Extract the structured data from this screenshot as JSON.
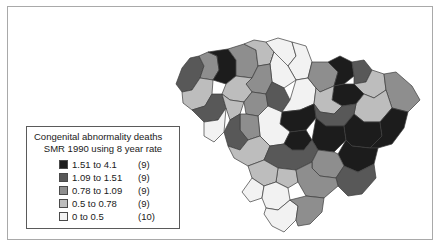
{
  "figure": {
    "kind": "choropleth-map",
    "region": "South Carolina counties",
    "background_color": "#ffffff",
    "frame_color": "#a9a9a9",
    "county_border_color": "#3c3c3c"
  },
  "legend": {
    "title_line_1": "Congenital abnormality deaths",
    "title_line_2": "SMR 1990 using 8 year rate",
    "rows": [
      {
        "range": "1.51 to 4.1",
        "count": "(9)",
        "color": "#1c1c1c"
      },
      {
        "range": "1.09 to 1.51",
        "count": "(9)",
        "color": "#585858"
      },
      {
        "range": "0.78 to 1.09",
        "count": "(9)",
        "color": "#8e8e8e"
      },
      {
        "range": "0.5 to 0.78",
        "count": "(9)",
        "color": "#bdbdbd"
      },
      {
        "range": "0 to 0.5",
        "count": "(10)",
        "color": "#f2f2f2"
      }
    ]
  },
  "chart_data": {
    "type": "map",
    "title": "Congenital abnormality deaths",
    "subtitle": "SMR 1990 using 8 year rate",
    "value_label": "SMR",
    "class_breaks": [
      0,
      0.5,
      0.78,
      1.09,
      1.51,
      4.1
    ],
    "class_counts": [
      10,
      9,
      9,
      9,
      9
    ],
    "class_colors": [
      "#f2f2f2",
      "#bdbdbd",
      "#8e8e8e",
      "#585858",
      "#1c1c1c"
    ],
    "total_regions": 46,
    "legend_position": "lower-left",
    "regions": [
      {
        "name": "Oconee",
        "class": 3,
        "points": "176,84 182,68 190,58 199,56 204,66 200,78 192,90 182,92"
      },
      {
        "name": "Pickens",
        "class": 2,
        "points": "199,56 204,66 200,78 213,80 219,70 217,56 208,52"
      },
      {
        "name": "Anderson",
        "class": 1,
        "points": "182,92 192,90 200,78 213,80 212,94 205,106 192,110 183,103"
      },
      {
        "name": "Greenville",
        "class": 4,
        "points": "208,52 217,56 219,70 213,80 226,84 236,76 236,60 228,49"
      },
      {
        "name": "Spartanburg",
        "class": 2,
        "points": "228,49 236,60 236,76 252,78 258,66 256,50 244,44"
      },
      {
        "name": "Cherokee",
        "class": 1,
        "points": "244,44 256,50 258,66 270,64 274,52 266,42 254,40"
      },
      {
        "name": "York",
        "class": 0,
        "points": "266,42 274,52 270,64 288,66 296,56 292,42 278,38"
      },
      {
        "name": "Lancaster",
        "class": 0,
        "points": "292,42 296,56 288,66 296,80 308,78 312,62 306,46"
      },
      {
        "name": "Chester",
        "class": 0,
        "points": "274,52 288,66 296,80 284,88 272,82 270,64"
      },
      {
        "name": "Union",
        "class": 2,
        "points": "252,78 258,66 270,64 272,82 266,94 252,92 246,84"
      },
      {
        "name": "Laurens",
        "class": 1,
        "points": "226,84 236,76 252,78 246,84 252,92 244,102 230,100 222,94"
      },
      {
        "name": "Abbeville",
        "class": 3,
        "points": "192,110 205,106 212,94 222,94 226,108 218,120 204,122"
      },
      {
        "name": "Greenwood",
        "class": 1,
        "points": "222,94 230,100 244,102 240,114 230,120 226,108"
      },
      {
        "name": "Newberry",
        "class": 2,
        "points": "244,102 252,92 266,94 268,106 258,116 246,114"
      },
      {
        "name": "Fairfield",
        "class": 3,
        "points": "266,94 272,82 284,88 290,100 282,112 270,110 268,106"
      },
      {
        "name": "Kershaw",
        "class": 0,
        "points": "290,100 296,80 308,78 316,88 314,104 300,110 282,112"
      },
      {
        "name": "Chesterfield",
        "class": 2,
        "points": "308,78 312,62 328,62 338,72 334,86 320,92 316,88"
      },
      {
        "name": "Marlboro",
        "class": 4,
        "points": "328,62 340,56 352,62 354,76 344,84 334,86 338,72"
      },
      {
        "name": "Dillon",
        "class": 3,
        "points": "352,62 364,60 372,70 366,82 354,84 354,76"
      },
      {
        "name": "Marion",
        "class": 1,
        "points": "366,82 372,70 384,74 386,90 374,98 364,94 354,84"
      },
      {
        "name": "Horry",
        "class": 2,
        "points": "384,74 396,72 412,86 420,100 408,112 392,108 386,90"
      },
      {
        "name": "Darlington",
        "class": 4,
        "points": "334,86 344,84 354,84 364,94 356,104 342,106 332,100"
      },
      {
        "name": "Florence",
        "class": 1,
        "points": "356,104 364,94 374,98 386,90 392,108 380,122 364,122 354,114"
      },
      {
        "name": "Lee",
        "class": 1,
        "points": "316,88 320,92 334,86 332,100 342,106 334,114 320,112 314,104"
      },
      {
        "name": "Sumter",
        "class": 3,
        "points": "314,104 320,112 334,114 342,106 356,104 354,114 344,126 326,126 316,118"
      },
      {
        "name": "Richland",
        "class": 4,
        "points": "282,112 300,110 314,104 316,118 306,130 290,132 280,124"
      },
      {
        "name": "Lexington",
        "class": 0,
        "points": "268,106 282,112 280,124 290,132 284,144 270,146 260,136 258,116"
      },
      {
        "name": "Saluda",
        "class": 2,
        "points": "246,114 258,116 260,136 248,140 240,130 240,114"
      },
      {
        "name": "Edgefield",
        "class": 3,
        "points": "230,120 240,114 240,130 248,140 240,150 228,146 224,132"
      },
      {
        "name": "McCormick",
        "class": 0,
        "points": "204,122 218,120 226,108 226,108 224,132 214,142 204,136"
      },
      {
        "name": "Aiken",
        "class": 1,
        "points": "228,146 240,150 248,140 260,136 270,146 264,160 248,166 234,158"
      },
      {
        "name": "Calhoun",
        "class": 4,
        "points": "284,144 290,132 306,130 312,140 304,150 292,150"
      },
      {
        "name": "Clarendon",
        "class": 4,
        "points": "312,140 316,118 326,126 344,126 346,140 334,152 318,150"
      },
      {
        "name": "Williamsburg",
        "class": 4,
        "points": "344,126 354,114 364,122 380,122 382,136 370,148 352,146 346,140"
      },
      {
        "name": "Georgetown",
        "class": 4,
        "points": "380,122 392,108 408,112 404,128 392,144 378,148 370,148 382,136"
      },
      {
        "name": "Berkeley",
        "class": 4,
        "points": "346,140 352,146 370,148 378,148 374,164 358,172 344,166 338,154"
      },
      {
        "name": "Orangeburg",
        "class": 3,
        "points": "264,160 270,146 284,144 292,150 304,150 312,140 318,150 312,162 296,170 278,168"
      },
      {
        "name": "Dorchester",
        "class": 2,
        "points": "312,162 318,150 334,152 338,154 344,166 336,178 320,176 312,168"
      },
      {
        "name": "Charleston",
        "class": 3,
        "points": "344,166 358,172 374,164 376,178 362,194 348,196 338,186 336,178"
      },
      {
        "name": "Bamberg",
        "class": 1,
        "points": "278,168 296,170 298,182 288,188 276,182"
      },
      {
        "name": "Barnwell",
        "class": 1,
        "points": "248,166 264,160 278,168 276,182 264,186 252,178"
      },
      {
        "name": "Allendale",
        "class": 0,
        "points": "252,178 264,186 262,198 250,202 242,192"
      },
      {
        "name": "Colleton",
        "class": 2,
        "points": "296,170 312,162 312,168 320,176 336,178 338,186 324,198 306,196 298,182"
      },
      {
        "name": "Hampton",
        "class": 0,
        "points": "262,198 264,186 276,182 288,188 290,200 278,210 266,208"
      },
      {
        "name": "Jasper",
        "class": 0,
        "points": "266,208 278,210 290,200 298,206 296,220 284,232 272,226 264,214"
      },
      {
        "name": "Beaufort",
        "class": 2,
        "points": "290,200 306,196 324,198 322,212 310,224 298,226 296,220 298,206"
      }
    ]
  }
}
